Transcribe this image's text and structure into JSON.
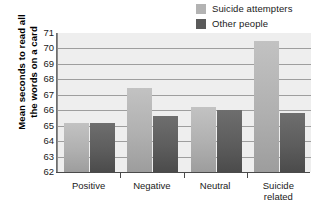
{
  "chart_data": {
    "type": "bar",
    "title": "",
    "xlabel": "",
    "ylabel": "Mean seconds to read all the words on a card",
    "ylabel_lines": [
      "Mean seconds to read all",
      "the words on a card"
    ],
    "ylim": [
      62,
      71
    ],
    "ytick_labels": [
      "71",
      "70",
      "69",
      "68",
      "67",
      "66",
      "65",
      "64",
      "63",
      "62"
    ],
    "yticks": [
      71,
      70,
      69,
      68,
      67,
      66,
      65,
      64,
      63,
      62
    ],
    "grid": true,
    "legend_position": "top-right",
    "categories": [
      "Positive",
      "Negative",
      "Neutral",
      "Suicide related"
    ],
    "category_label_lines": [
      [
        "Positive"
      ],
      [
        "Negative"
      ],
      [
        "Neutral"
      ],
      [
        "Suicide",
        "related"
      ]
    ],
    "series": [
      {
        "name": "Suicide attempters",
        "color": "#b3b3b3",
        "values": [
          65.2,
          67.45,
          66.2,
          70.5
        ]
      },
      {
        "name": "Other people",
        "color": "#5a5a5a",
        "values": [
          65.2,
          65.6,
          66.0,
          65.85
        ]
      }
    ]
  },
  "legend": {
    "items": [
      {
        "label": "Suicide attempters",
        "color": "#b3b3b3"
      },
      {
        "label": "Other people",
        "color": "#5a5a5a"
      }
    ]
  },
  "axes": {
    "y_title_line1": "Mean seconds to read all",
    "y_title_line2": "the words on a card"
  }
}
